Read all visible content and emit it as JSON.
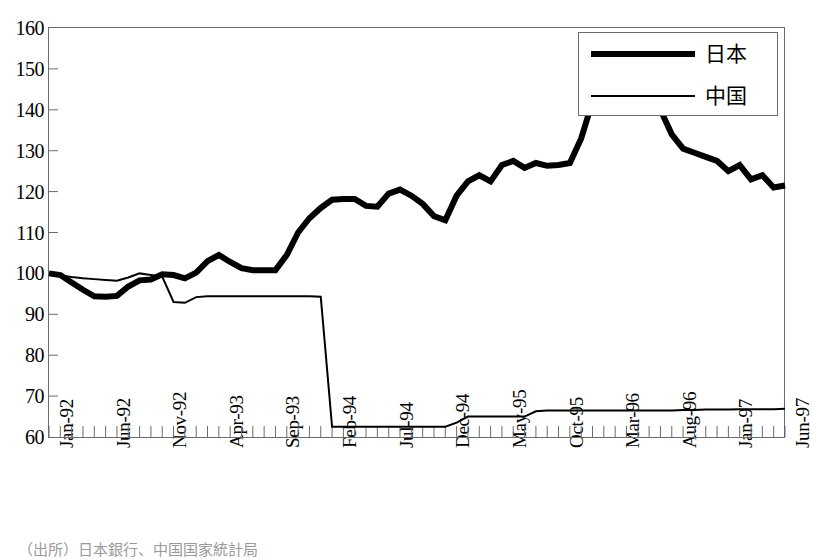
{
  "chart_data": {
    "type": "line",
    "title": "",
    "xlabel": "",
    "ylabel": "",
    "ylim": [
      60,
      160
    ],
    "ytick_step": 10,
    "yticks": [
      60,
      70,
      80,
      90,
      100,
      110,
      120,
      130,
      140,
      150,
      160
    ],
    "grid": false,
    "legend_position": "top-right",
    "x_tick_label_every": 5,
    "x_tick_rotation": -90,
    "x_all_ticks_count": 66,
    "x_start": "Jan-92",
    "x_end": "Jun-97",
    "xticklabels": [
      "Jan-92",
      "Jun-92",
      "Nov-92",
      "Apr-93",
      "Sep-93",
      "Feb-94",
      "Jul-94",
      "Dec-94",
      "May-95",
      "Oct-95",
      "Mar-96",
      "Aug-96",
      "Jan-97",
      "Jun-97"
    ],
    "x": [
      "Jan-92",
      "Feb-92",
      "Mar-92",
      "Apr-92",
      "May-92",
      "Jun-92",
      "Jul-92",
      "Aug-92",
      "Sep-92",
      "Oct-92",
      "Nov-92",
      "Dec-92",
      "Jan-93",
      "Feb-93",
      "Mar-93",
      "Apr-93",
      "May-93",
      "Jun-93",
      "Jul-93",
      "Aug-93",
      "Sep-93",
      "Oct-93",
      "Nov-93",
      "Dec-93",
      "Jan-94",
      "Feb-94",
      "Mar-94",
      "Apr-94",
      "May-94",
      "Jun-94",
      "Jul-94",
      "Aug-94",
      "Sep-94",
      "Oct-94",
      "Nov-94",
      "Dec-94",
      "Jan-95",
      "Feb-95",
      "Mar-95",
      "Apr-95",
      "May-95",
      "Jun-95",
      "Jul-95",
      "Aug-95",
      "Sep-95",
      "Oct-95",
      "Nov-95",
      "Dec-95",
      "Jan-96",
      "Feb-96",
      "Mar-96",
      "Apr-96",
      "May-96",
      "Jun-96",
      "Jul-96",
      "Aug-96",
      "Sep-96",
      "Oct-96",
      "Nov-96",
      "Dec-96",
      "Jan-97",
      "Feb-97",
      "Mar-97",
      "Apr-97",
      "May-97",
      "Jun-97"
    ],
    "series": [
      {
        "name": "日本",
        "style": "thick",
        "color": "#000000",
        "linewidth": 6,
        "values": [
          100.0,
          99.6,
          97.8,
          96.0,
          94.4,
          94.3,
          94.5,
          96.8,
          98.3,
          98.5,
          99.8,
          99.6,
          98.8,
          100.2,
          103.0,
          104.5,
          102.8,
          101.3,
          100.8,
          100.8,
          100.8,
          104.5,
          110.0,
          113.5,
          116.0,
          118.0,
          118.2,
          118.2,
          116.5,
          116.3,
          119.5,
          120.5,
          119.0,
          117.0,
          114.0,
          113.0,
          119.0,
          122.5,
          124.0,
          122.5,
          126.5,
          127.5,
          125.8,
          127.0,
          126.3,
          126.5,
          127.0,
          133.0,
          142.0,
          148.0,
          149.5,
          149.5,
          148.5,
          145.0,
          140.0,
          134.0,
          130.5,
          129.5,
          128.5,
          127.5,
          125.0,
          126.5,
          123.0,
          124.0,
          121.0,
          121.5
        ]
      },
      {
        "name": "中国",
        "style": "thin",
        "color": "#000000",
        "linewidth": 2,
        "values": [
          100.0,
          99.5,
          99.1,
          98.8,
          98.6,
          98.4,
          98.2,
          99.0,
          100.0,
          99.6,
          99.2,
          93.0,
          92.8,
          94.2,
          94.4,
          94.4,
          94.4,
          94.4,
          94.4,
          94.4,
          94.4,
          94.4,
          94.4,
          94.4,
          94.3,
          62.5,
          62.5,
          62.5,
          62.5,
          62.5,
          62.5,
          62.5,
          62.5,
          62.5,
          62.5,
          62.5,
          63.5,
          65.0,
          65.0,
          65.0,
          65.0,
          65.0,
          65.0,
          66.3,
          66.5,
          66.5,
          66.5,
          66.5,
          66.5,
          66.5,
          66.5,
          66.5,
          66.5,
          66.5,
          66.5,
          66.5,
          66.6,
          66.6,
          66.7,
          66.7,
          66.7,
          66.8,
          66.8,
          66.8,
          66.8,
          66.9
        ]
      }
    ],
    "japan_extended_tail": [
      125.0,
      126.5,
      123.0,
      124.0,
      120.0,
      121.5,
      118.0,
      117.0,
      113.5,
      111.5,
      112.5,
      110.0,
      106.0,
      99.0,
      101.0,
      111.0
    ],
    "annotations": []
  },
  "legend": {
    "items": [
      {
        "label": "日本",
        "style": "thick"
      },
      {
        "label": "中国",
        "style": "thin"
      }
    ]
  },
  "caption": {
    "text": "（出所）日本銀行、中国国家統計局"
  },
  "colors": {
    "line": "#000000",
    "axis": "#6b6b6b",
    "background": "#ffffff"
  }
}
